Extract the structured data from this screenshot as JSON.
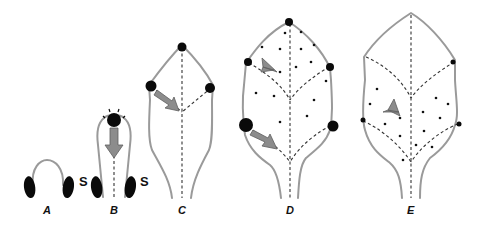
{
  "figure": {
    "panels": [
      {
        "id": "A",
        "label": "A"
      },
      {
        "id": "B",
        "label": "B"
      },
      {
        "id": "C",
        "label": "C"
      },
      {
        "id": "D",
        "label": "D"
      },
      {
        "id": "E",
        "label": "E"
      }
    ],
    "stipule_labels": [
      "S",
      "S"
    ],
    "colors": {
      "outline": "#9a9a9a",
      "hydathode": "#0a0a0a",
      "arrow": "#8c8c8c",
      "vein": "#333333",
      "background": "#ffffff"
    }
  }
}
